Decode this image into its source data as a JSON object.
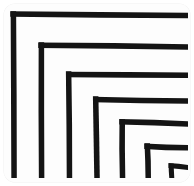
{
  "artwork": {
    "title": "Nested Corners",
    "style": "hand-drawn ink",
    "background_color": "#ffffff",
    "card_color": "#fdfdfd",
    "ink_color": "#141414",
    "canvas": {
      "width": 194,
      "height": 186
    },
    "card": {
      "x": 4,
      "y": 4,
      "width": 186,
      "height": 178,
      "corner_radius": 11
    }
  },
  "chart_data": {
    "type": "line",
    "xlabel": "",
    "ylabel": "",
    "xlim": [
      0,
      194
    ],
    "ylim": [
      0,
      186
    ],
    "grid": false,
    "legend": "none",
    "series": [
      {
        "name": "corner-1",
        "corner_x": 13,
        "corner_y": 14,
        "vertical_bottom": 178,
        "horizontal_right": 188,
        "stroke_width": 5.5
      },
      {
        "name": "corner-2",
        "corner_x": 41,
        "corner_y": 45,
        "vertical_bottom": 178,
        "horizontal_right": 188,
        "stroke_width": 5.5
      },
      {
        "name": "corner-3",
        "corner_x": 69,
        "corner_y": 74,
        "vertical_bottom": 178,
        "horizontal_right": 188,
        "stroke_width": 5.5
      },
      {
        "name": "corner-4",
        "corner_x": 96,
        "corner_y": 99,
        "vertical_bottom": 178,
        "horizontal_right": 188,
        "stroke_width": 5.5
      },
      {
        "name": "corner-5",
        "corner_x": 122,
        "corner_y": 122,
        "vertical_bottom": 178,
        "horizontal_right": 188,
        "stroke_width": 5.5
      },
      {
        "name": "corner-6",
        "corner_x": 147,
        "corner_y": 146,
        "vertical_bottom": 178,
        "horizontal_right": 188,
        "stroke_width": 5.5
      },
      {
        "name": "corner-7",
        "corner_x": 171,
        "corner_y": 166,
        "vertical_bottom": 178,
        "horizontal_right": 188,
        "stroke_width": 5.0
      }
    ],
    "vertical_bar_count": 7,
    "horizontal_bar_count": 6
  }
}
